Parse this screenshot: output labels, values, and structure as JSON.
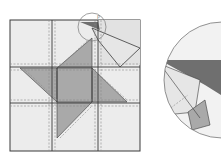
{
  "diagram": {
    "type": "quilt-block-assembly",
    "grid": {
      "rows": 3,
      "cols": 3
    },
    "magnifier_label": "P",
    "colors": {
      "patch_light": "#ececec",
      "patch_medium": "#a9a9a9",
      "patch_dark": "#6f6f6f",
      "outline": "#3a3a3a",
      "seam": "#8a8a8a",
      "background": "#ffffff"
    },
    "elements": [
      {
        "id": "quilt-block",
        "desc": "3x3 square quilt block with dashed seam allowances"
      },
      {
        "id": "center-square",
        "desc": "medium gray center patch"
      },
      {
        "id": "pinwheel-triangles",
        "desc": "four medium gray triangles arranged as pinwheel around center"
      },
      {
        "id": "folded-flap",
        "desc": "top-right corner triangle flap folded outward beyond block edge"
      },
      {
        "id": "magnifier-circle",
        "desc": "small circle marking detail point P at top edge"
      },
      {
        "id": "detail-inset",
        "desc": "enlarged circular inset of point P shown to the right"
      }
    ]
  }
}
